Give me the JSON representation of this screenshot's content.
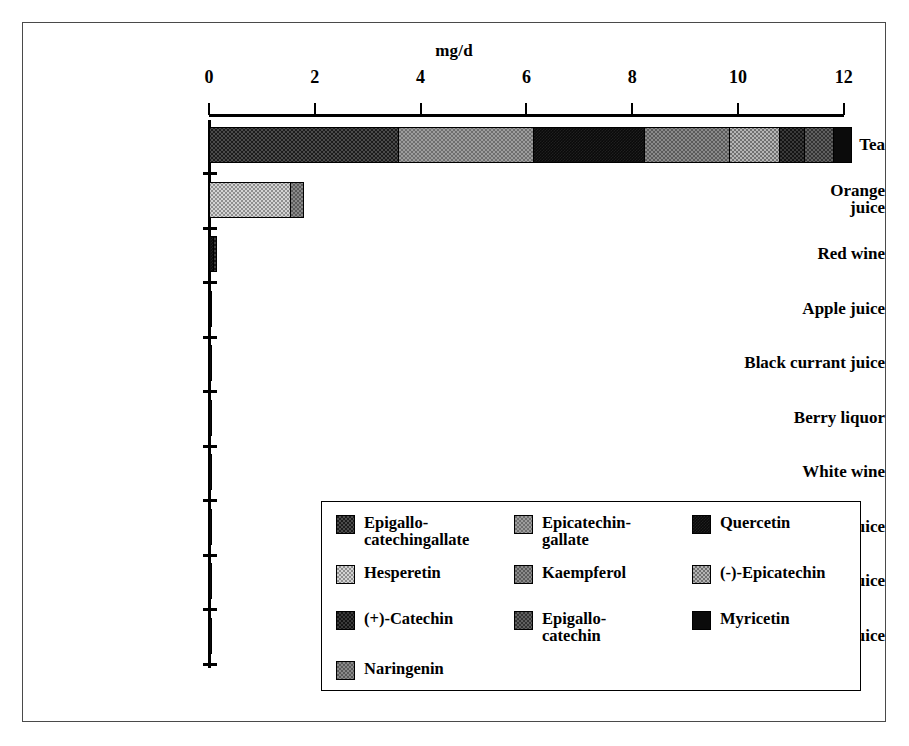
{
  "figure": {
    "axis_title": "mg/d",
    "frame_color": "#4a4a4a"
  },
  "chart_data": {
    "type": "bar",
    "orientation": "horizontal",
    "stacked": true,
    "title": "",
    "xlabel": "mg/d",
    "ylabel": "",
    "xlim": [
      0,
      12.6
    ],
    "xticks": [
      0,
      2,
      4,
      6,
      8,
      10,
      12
    ],
    "xtick_labels": [
      "0",
      "2",
      "4",
      "6",
      "8",
      "10",
      "12"
    ],
    "grid": false,
    "legend_position": "inside-bottom-right",
    "categories": [
      "Tea",
      "Orange\njuice",
      "Red wine",
      "Apple juice",
      "Black currant juice",
      "Berry liquor",
      "White wine",
      "Mixed berry juice",
      "Cranberry juice",
      "Tomato juice"
    ],
    "series": [
      {
        "name": "Epigallo-catechingallate",
        "pattern": "p-dark",
        "values": [
          3.6,
          0,
          0,
          0,
          0,
          0,
          0,
          0,
          0,
          0
        ]
      },
      {
        "name": "Epicatechin-gallate",
        "pattern": "p-medium",
        "values": [
          2.55,
          0,
          0,
          0,
          0,
          0,
          0,
          0,
          0,
          0
        ]
      },
      {
        "name": "Quercetin",
        "pattern": "p-black",
        "values": [
          2.1,
          0,
          0.1,
          0.03,
          0,
          0,
          0,
          0,
          0,
          0
        ]
      },
      {
        "name": "Hesperetin",
        "pattern": "p-light",
        "values": [
          0,
          1.55,
          0,
          0,
          0,
          0,
          0,
          0,
          0,
          0
        ]
      },
      {
        "name": "Kaempferol",
        "pattern": "p-grey",
        "values": [
          1.6,
          0,
          0,
          0,
          0,
          0,
          0,
          0,
          0,
          0
        ]
      },
      {
        "name": "(-)-Epicatechin",
        "pattern": "p-midlight",
        "values": [
          0.95,
          0,
          0,
          0,
          0,
          0,
          0,
          0,
          0,
          0
        ]
      },
      {
        "name": "(+)-Catechin",
        "pattern": "p-verydark",
        "values": [
          0.47,
          0,
          0.05,
          0.02,
          0,
          0,
          0,
          0,
          0,
          0
        ]
      },
      {
        "name": "Epigallo-catechin",
        "pattern": "p-darkgrey",
        "values": [
          0.55,
          0,
          0,
          0,
          0,
          0,
          0,
          0,
          0,
          0
        ]
      },
      {
        "name": "Myricetin",
        "pattern": "p-solid",
        "values": [
          0.33,
          0,
          0,
          0,
          0,
          0,
          0,
          0,
          0,
          0
        ]
      },
      {
        "name": "Naringenin",
        "pattern": "p-grey",
        "values": [
          0,
          0.25,
          0,
          0,
          0,
          0,
          0,
          0,
          0,
          0
        ]
      }
    ],
    "totals": [
      12.15,
      1.8,
      0.15,
      0.05,
      0.02,
      0.01,
      0.01,
      0.01,
      0.01,
      0.01
    ]
  },
  "legend": {
    "items": [
      {
        "label": "Epigallo-\ncatechingallate",
        "pattern": "p-dark",
        "col": 0,
        "row": 0
      },
      {
        "label": "Epicatechin-\ngallate",
        "pattern": "p-medium",
        "col": 1,
        "row": 0
      },
      {
        "label": "Quercetin",
        "pattern": "p-black",
        "col": 2,
        "row": 0
      },
      {
        "label": "Hesperetin",
        "pattern": "p-light",
        "col": 0,
        "row": 1
      },
      {
        "label": "Kaempferol",
        "pattern": "p-grey",
        "col": 1,
        "row": 1
      },
      {
        "label": "(-)-Epicatechin",
        "pattern": "p-midlight",
        "col": 2,
        "row": 1
      },
      {
        "label": "(+)-Catechin",
        "pattern": "p-verydark",
        "col": 0,
        "row": 2
      },
      {
        "label": "Epigallo-\ncatechin",
        "pattern": "p-darkgrey",
        "col": 1,
        "row": 2
      },
      {
        "label": "Myricetin",
        "pattern": "p-solid",
        "col": 2,
        "row": 2
      },
      {
        "label": "Naringenin",
        "pattern": "p-grey",
        "col": 0,
        "row": 3
      }
    ]
  }
}
